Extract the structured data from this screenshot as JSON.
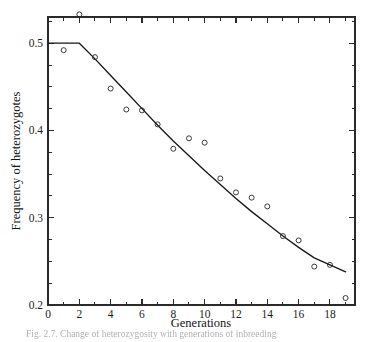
{
  "figure": {
    "caption": "Fig. 2.7.  Change of heterozygosity with generations of inbreeding"
  },
  "chart_data": {
    "type": "scatter",
    "title": "",
    "xlabel": "Generations",
    "ylabel": "Frequency of heterozygotes",
    "xlim": [
      0,
      19.6
    ],
    "ylim": [
      0.2,
      0.53
    ],
    "grid": false,
    "legend": "none",
    "x_ticks": [
      0,
      2,
      4,
      6,
      8,
      10,
      12,
      14,
      16,
      18
    ],
    "x_tick_labels": [
      "0",
      "2",
      "4",
      "6",
      "8",
      "10",
      "12",
      "14",
      "16",
      "18"
    ],
    "x_minor_ticks": [
      1,
      3,
      5,
      7,
      9,
      11,
      13,
      15,
      17,
      19
    ],
    "y_ticks": [
      0.2,
      0.3,
      0.4,
      0.5
    ],
    "y_tick_labels": [
      "0.2",
      "0.3",
      "0.4",
      "0.5"
    ],
    "y_minor_ticks": [
      0.225,
      0.25,
      0.275,
      0.325,
      0.35,
      0.375,
      0.425,
      0.45,
      0.475,
      0.525
    ],
    "series": [
      {
        "name": "Observed heterozygote frequency",
        "marker": "open-circle",
        "x": [
          1,
          2,
          3,
          4,
          5,
          6,
          7,
          8,
          9,
          10,
          11,
          12,
          13,
          14,
          15,
          16,
          17,
          18,
          19
        ],
        "y": [
          0.492,
          0.533,
          0.484,
          0.448,
          0.424,
          0.423,
          0.407,
          0.379,
          0.391,
          0.386,
          0.345,
          0.329,
          0.323,
          0.313,
          0.279,
          0.274,
          0.244,
          0.246,
          0.208
        ]
      },
      {
        "name": "Expected (fitted) curve",
        "marker": "line",
        "x": [
          0,
          2,
          3,
          4,
          5,
          6,
          7,
          8,
          9,
          10,
          11,
          12,
          13,
          14,
          15,
          16,
          17,
          18,
          19
        ],
        "y": [
          0.5,
          0.5,
          0.482,
          0.463,
          0.444,
          0.425,
          0.406,
          0.388,
          0.371,
          0.354,
          0.338,
          0.322,
          0.307,
          0.293,
          0.279,
          0.266,
          0.254,
          0.246,
          0.238
        ]
      }
    ]
  }
}
